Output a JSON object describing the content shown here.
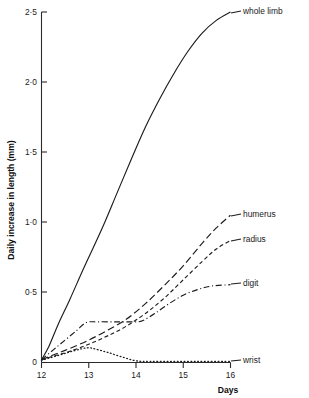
{
  "chart_data": {
    "type": "line",
    "title": "",
    "xlabel": "Days",
    "ylabel": "Daily increase in length (mm)",
    "xlim": [
      12,
      16
    ],
    "ylim": [
      0,
      2.5
    ],
    "xticks": [
      "12",
      "13",
      "14",
      "15",
      "16"
    ],
    "xtick_values": [
      12,
      13,
      14,
      15,
      16
    ],
    "yticks": [
      "0",
      "0·5",
      "1·0",
      "1·5",
      "2·0",
      "2·5"
    ],
    "ytick_values": [
      0,
      0.5,
      1.0,
      1.5,
      2.0,
      2.5
    ],
    "grid": false,
    "legend_position": "right-inline-labels",
    "series": [
      {
        "name": "whole limb",
        "style": "solid",
        "label": "whole limb",
        "x": [
          12.0,
          12.15,
          12.35,
          12.6,
          12.85,
          13.0,
          13.3,
          13.6,
          13.9,
          14.2,
          14.5,
          14.8,
          15.1,
          15.4,
          15.7,
          16.0
        ],
        "values": [
          0.02,
          0.11,
          0.27,
          0.45,
          0.64,
          0.75,
          0.97,
          1.21,
          1.45,
          1.68,
          1.88,
          2.06,
          2.22,
          2.35,
          2.44,
          2.5
        ]
      },
      {
        "name": "humerus",
        "style": "long-dash",
        "label": "humerus",
        "x": [
          12.0,
          12.3,
          12.6,
          13.0,
          13.4,
          13.8,
          14.2,
          14.6,
          15.0,
          15.4,
          15.7,
          16.0
        ],
        "values": [
          0.02,
          0.06,
          0.1,
          0.16,
          0.23,
          0.31,
          0.42,
          0.55,
          0.69,
          0.85,
          0.96,
          1.05
        ]
      },
      {
        "name": "radius",
        "style": "short-dash",
        "label": "radius",
        "x": [
          12.0,
          12.3,
          12.6,
          13.0,
          13.4,
          13.8,
          14.2,
          14.6,
          15.0,
          15.4,
          15.7,
          16.0
        ],
        "values": [
          0.02,
          0.05,
          0.08,
          0.13,
          0.19,
          0.26,
          0.35,
          0.46,
          0.59,
          0.72,
          0.81,
          0.87
        ]
      },
      {
        "name": "digit",
        "style": "dash-dot",
        "label": "digit",
        "x": [
          12.0,
          12.25,
          12.5,
          12.75,
          12.95,
          13.2,
          13.6,
          14.0,
          14.15,
          14.4,
          14.7,
          15.0,
          15.3,
          15.6,
          16.0
        ],
        "values": [
          0.02,
          0.09,
          0.16,
          0.23,
          0.285,
          0.29,
          0.29,
          0.29,
          0.3,
          0.35,
          0.42,
          0.48,
          0.52,
          0.545,
          0.555
        ]
      },
      {
        "name": "wrist",
        "style": "dotted",
        "label": "wrist",
        "x": [
          12.0,
          12.3,
          12.6,
          12.85,
          13.0,
          13.15,
          13.4,
          13.7,
          14.0,
          14.3,
          14.7,
          15.1,
          15.5,
          16.0
        ],
        "values": [
          0.015,
          0.045,
          0.075,
          0.098,
          0.105,
          0.095,
          0.072,
          0.04,
          0.012,
          0.008,
          0.008,
          0.008,
          0.008,
          0.008
        ]
      }
    ]
  },
  "axis": {
    "y_title": "Daily increase in length (mm)",
    "x_title": "Days"
  },
  "labels": {
    "whole_limb": "whole limb",
    "humerus": "humerus",
    "radius": "radius",
    "digit": "digit",
    "wrist": "wrist"
  },
  "colors": {
    "ink": "#1c1c1c",
    "background": "#ffffff"
  }
}
